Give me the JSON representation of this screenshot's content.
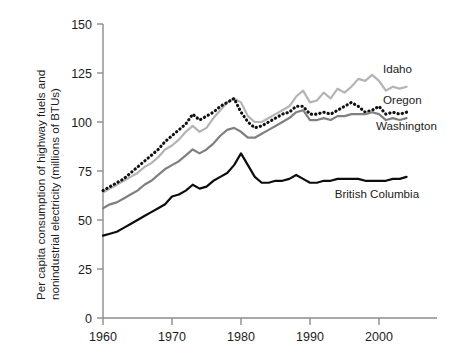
{
  "chart_data": {
    "type": "line",
    "title": "",
    "xlabel": "",
    "ylabel": "Per capita consumption of highway fuels and nonindustrial electricity (millions of BTUs)",
    "ylabel_line1": "Per capita consumption of highway fuels and",
    "ylabel_line2": "nonindustrial electricity (millions of BTUs)",
    "xlim": [
      1960,
      2005
    ],
    "ylim": [
      0,
      150
    ],
    "xticks": [
      1960,
      1970,
      1980,
      1990,
      2000
    ],
    "xtick_labels": [
      "1960",
      "1970",
      "1980",
      "1990",
      "2000"
    ],
    "yticks": [
      0,
      25,
      50,
      75,
      100,
      125,
      150
    ],
    "ytick_labels": [
      "0",
      "25",
      "50",
      "75",
      "100",
      "125",
      "150"
    ],
    "grid": false,
    "legend_position": "inline-right",
    "x": [
      1960,
      1961,
      1962,
      1963,
      1964,
      1965,
      1966,
      1967,
      1968,
      1969,
      1970,
      1971,
      1972,
      1973,
      1974,
      1975,
      1976,
      1977,
      1978,
      1979,
      1980,
      1981,
      1982,
      1983,
      1984,
      1985,
      1986,
      1987,
      1988,
      1989,
      1990,
      1991,
      1992,
      1993,
      1994,
      1995,
      1996,
      1997,
      1998,
      1999,
      2000,
      2001,
      2002,
      2003,
      2004
    ],
    "series": [
      {
        "name": "Idaho",
        "color": "#b4b4b4",
        "style": "solid",
        "label": "Idaho",
        "values": [
          64,
          66,
          68,
          70,
          72,
          74,
          77,
          79,
          82,
          86,
          88,
          91,
          95,
          98,
          95,
          97,
          102,
          106,
          110,
          112,
          110,
          103,
          100,
          100,
          102,
          104,
          106,
          108,
          113,
          116,
          110,
          111,
          115,
          112,
          117,
          115,
          118,
          122,
          121,
          124,
          121,
          116,
          118,
          117,
          118
        ]
      },
      {
        "name": "Oregon",
        "color": "#111111",
        "style": "dotted",
        "label": "Oregon",
        "values": [
          65,
          67,
          69,
          71,
          74,
          77,
          80,
          83,
          86,
          90,
          93,
          96,
          99,
          104,
          101,
          103,
          105,
          108,
          110,
          112,
          105,
          100,
          97,
          98,
          100,
          102,
          104,
          105,
          108,
          108,
          104,
          104,
          105,
          104,
          106,
          108,
          110,
          108,
          105,
          106,
          108,
          104,
          105,
          104,
          105
        ]
      },
      {
        "name": "Washington",
        "color": "#808080",
        "style": "solid",
        "label": "Washington",
        "values": [
          56,
          58,
          59,
          61,
          63,
          65,
          68,
          70,
          73,
          76,
          78,
          80,
          83,
          86,
          84,
          86,
          89,
          93,
          96,
          97,
          95,
          92,
          92,
          94,
          96,
          98,
          100,
          102,
          105,
          106,
          101,
          101,
          102,
          101,
          103,
          103,
          104,
          104,
          104,
          105,
          104,
          101,
          102,
          101,
          102
        ]
      },
      {
        "name": "British Columbia",
        "color": "#0d0d0d",
        "style": "solid",
        "label": "British Columbia",
        "values": [
          42,
          43,
          44,
          46,
          48,
          50,
          52,
          54,
          56,
          58,
          62,
          63,
          65,
          68,
          66,
          67,
          70,
          72,
          74,
          78,
          84,
          78,
          72,
          69,
          69,
          70,
          70,
          71,
          73,
          71,
          69,
          69,
          70,
          70,
          71,
          71,
          71,
          71,
          70,
          70,
          70,
          70,
          71,
          71,
          72
        ]
      }
    ],
    "annotations": [
      {
        "text": "Idaho",
        "x": 2000,
        "y": 125
      },
      {
        "text": "Oregon",
        "x": 2000,
        "y": 109
      },
      {
        "text": "Washington",
        "x": 1999,
        "y": 96
      },
      {
        "text": "British Columbia",
        "x": 1993,
        "y": 61
      }
    ]
  },
  "axis": {
    "y_title_line1": "Per capita consumption of highway fuels and",
    "y_title_line2": "nonindustrial electricity (millions of BTUs)"
  }
}
